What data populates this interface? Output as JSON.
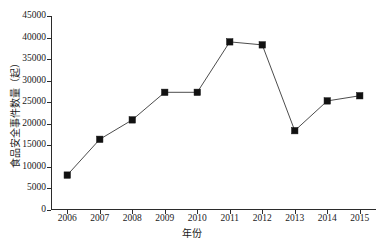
{
  "chart_data": {
    "type": "line",
    "title": "",
    "xlabel": "年份",
    "ylabel": "食品安全事件数量（起）",
    "categories": [
      "2006",
      "2007",
      "2008",
      "2009",
      "2010",
      "2011",
      "2012",
      "2013",
      "2014",
      "2015"
    ],
    "values": [
      8100,
      16400,
      20900,
      27300,
      27300,
      39000,
      38300,
      18400,
      25300,
      26500
    ],
    "series": [
      {
        "name": "食品安全事件数量",
        "values": [
          8100,
          16400,
          20900,
          27300,
          27300,
          39000,
          38300,
          18400,
          25300,
          26500
        ]
      }
    ],
    "ylim": [
      0,
      45000
    ],
    "ytick_labels": [
      "0",
      "5000",
      "10000",
      "15000",
      "20000",
      "25000",
      "30000",
      "35000",
      "40000",
      "45000"
    ],
    "ytick_values": [
      0,
      5000,
      10000,
      15000,
      20000,
      25000,
      30000,
      35000,
      40000,
      45000
    ],
    "xtick_labels": [
      "2006",
      "2007",
      "2008",
      "2009",
      "2010",
      "2011",
      "2012",
      "2013",
      "2014",
      "2015"
    ],
    "grid": false,
    "legend": false,
    "legend_position": "none",
    "marker": "square",
    "line_color": "#4d4d4d",
    "marker_color": "#111111",
    "axis_color": "#2b2b2b",
    "background_color": "#ffffff"
  }
}
